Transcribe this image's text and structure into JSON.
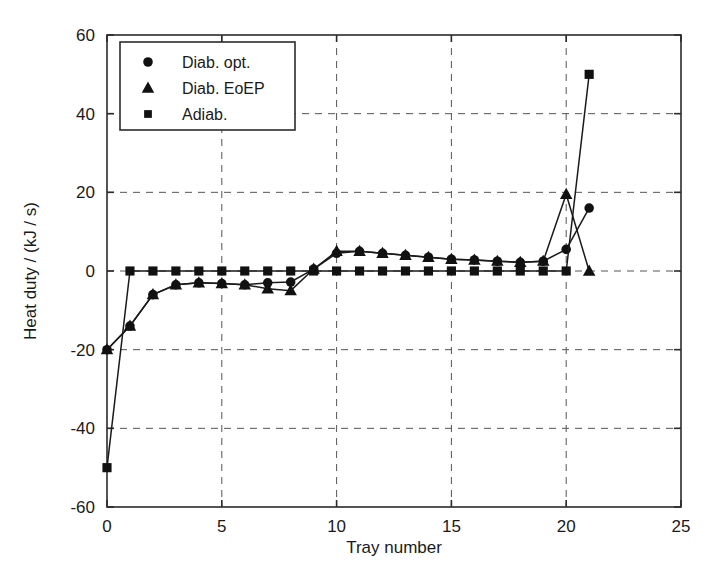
{
  "chart_data": {
    "type": "line",
    "title": "",
    "xlabel": "Tray number",
    "ylabel": "Heat duty / (kJ / s)",
    "xlim": [
      0,
      25
    ],
    "ylim": [
      -60,
      60
    ],
    "xticks": [
      0,
      5,
      10,
      15,
      20,
      25
    ],
    "yticks": [
      -60,
      -40,
      -20,
      0,
      20,
      40,
      60
    ],
    "xtick_labels": [
      "0",
      "5",
      "10",
      "15",
      "20",
      "25"
    ],
    "ytick_labels": [
      "-60",
      "-40",
      "-20",
      "0",
      "20",
      "40",
      "60"
    ],
    "grid": true,
    "grid_style": "dashed",
    "legend_position": "upper left",
    "line_color": "#1a1a1a",
    "marker_color": "#111111",
    "background_color": "#ffffff",
    "x": [
      0,
      1,
      2,
      3,
      4,
      5,
      6,
      7,
      8,
      9,
      10,
      11,
      12,
      13,
      14,
      15,
      16,
      17,
      18,
      19,
      20,
      21
    ],
    "series": [
      {
        "name": "Diab. opt.",
        "marker": "circle",
        "values": [
          -20,
          -14,
          -6,
          -3.5,
          -3,
          -3.2,
          -3.5,
          -3,
          -2.8,
          0.5,
          4.5,
          5,
          4.5,
          4,
          3.5,
          3,
          2.8,
          2.5,
          2.2,
          2.5,
          5.5,
          16
        ]
      },
      {
        "name": "Diab. EoEP",
        "marker": "triangle",
        "values": [
          -20,
          -14,
          -6,
          -3.5,
          -3,
          -3.2,
          -3.5,
          -4.5,
          -5,
          0.5,
          5,
          5,
          4.5,
          4,
          3.5,
          3,
          2.8,
          2.5,
          2.2,
          2.5,
          19.5,
          0
        ]
      },
      {
        "name": "Adiab.",
        "marker": "square",
        "values": [
          -50,
          0,
          0,
          0,
          0,
          0,
          0,
          0,
          0,
          0,
          0,
          0,
          0,
          0,
          0,
          0,
          0,
          0,
          0,
          0,
          0,
          50
        ]
      }
    ]
  },
  "legend": {
    "entries": [
      {
        "label": "Diab. opt.",
        "marker": "circle"
      },
      {
        "label": "Diab. EoEP",
        "marker": "triangle"
      },
      {
        "label": "Adiab.",
        "marker": "square"
      }
    ]
  }
}
